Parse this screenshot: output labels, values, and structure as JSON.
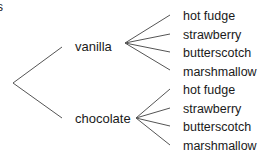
{
  "clipped_fragment": "s",
  "tree": {
    "root": {
      "x": 13,
      "y": 83
    },
    "branches": [
      {
        "label": "vanilla",
        "line_end": {
          "x": 62,
          "y": 47
        },
        "label_pos": {
          "x": 75,
          "y": 51
        },
        "fork": {
          "x": 125,
          "y": 43
        },
        "leaves": [
          {
            "label": "hot fudge",
            "line_end": {
              "x": 170,
              "y": 15
            },
            "label_pos": {
              "x": 183,
              "y": 20
            }
          },
          {
            "label": "strawberry",
            "line_end": {
              "x": 170,
              "y": 34
            },
            "label_pos": {
              "x": 183,
              "y": 39
            }
          },
          {
            "label": "butterscotch",
            "line_end": {
              "x": 170,
              "y": 52
            },
            "label_pos": {
              "x": 183,
              "y": 57
            }
          },
          {
            "label": "marshmallow",
            "line_end": {
              "x": 170,
              "y": 70
            },
            "label_pos": {
              "x": 183,
              "y": 76
            }
          }
        ]
      },
      {
        "label": "chocolate",
        "line_end": {
          "x": 62,
          "y": 118
        },
        "label_pos": {
          "x": 75,
          "y": 123
        },
        "fork": {
          "x": 136,
          "y": 118
        },
        "leaves": [
          {
            "label": "hot fudge",
            "line_end": {
              "x": 170,
              "y": 89
            },
            "label_pos": {
              "x": 183,
              "y": 94
            }
          },
          {
            "label": "strawberry",
            "line_end": {
              "x": 170,
              "y": 108
            },
            "label_pos": {
              "x": 183,
              "y": 113
            }
          },
          {
            "label": "butterscotch",
            "line_end": {
              "x": 170,
              "y": 126
            },
            "label_pos": {
              "x": 183,
              "y": 131
            }
          },
          {
            "label": "marshmallow",
            "line_end": {
              "x": 170,
              "y": 145
            },
            "label_pos": {
              "x": 183,
              "y": 150
            }
          }
        ]
      }
    ]
  }
}
